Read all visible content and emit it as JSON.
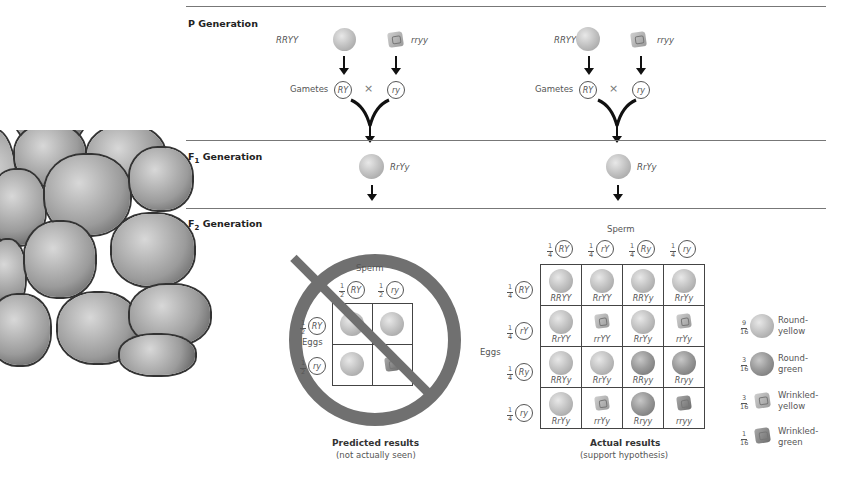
{
  "sections": {
    "p": {
      "label": "P Generation"
    },
    "f1": {
      "label_main": "F",
      "label_sub": "1",
      "label_rest": " Generation"
    },
    "f2": {
      "label_main": "F",
      "label_sub": "2",
      "label_rest": " Generation"
    }
  },
  "left_cross": {
    "parent1": "RRYY",
    "parent2": "rryy",
    "gametes_label": "Gametes",
    "gamete1": "RY",
    "gamete2": "ry",
    "cross_symbol": "×",
    "f1_genotype": "RrYy"
  },
  "right_cross": {
    "parent1": "RRYY",
    "parent2": "rryy",
    "gametes_label": "Gametes",
    "gamete1": "RY",
    "gamete2": "ry",
    "cross_symbol": "×",
    "f1_genotype": "RrYy"
  },
  "predicted": {
    "sperm_label": "Sperm",
    "eggs_label": "Eggs",
    "sperm": [
      {
        "frac_n": "1",
        "frac_d": "2",
        "allele": "RY"
      },
      {
        "frac_n": "1",
        "frac_d": "2",
        "allele": "ry"
      }
    ],
    "eggs": [
      {
        "frac_n": "1",
        "frac_d": "2",
        "allele": "RY"
      },
      {
        "frac_n": "1",
        "frac_d": "2",
        "allele": "ry"
      }
    ],
    "title": "Predicted results",
    "subtitle": "(not actually seen)"
  },
  "actual": {
    "sperm_label": "Sperm",
    "eggs_label": "Eggs",
    "sperm": [
      {
        "frac_n": "1",
        "frac_d": "4",
        "allele": "RY"
      },
      {
        "frac_n": "1",
        "frac_d": "4",
        "allele": "rY"
      },
      {
        "frac_n": "1",
        "frac_d": "4",
        "allele": "Ry"
      },
      {
        "frac_n": "1",
        "frac_d": "4",
        "allele": "ry"
      }
    ],
    "eggs": [
      {
        "frac_n": "1",
        "frac_d": "4",
        "allele": "RY"
      },
      {
        "frac_n": "1",
        "frac_d": "4",
        "allele": "rY"
      },
      {
        "frac_n": "1",
        "frac_d": "4",
        "allele": "Ry"
      },
      {
        "frac_n": "1",
        "frac_d": "4",
        "allele": "ry"
      }
    ],
    "rows": [
      [
        "RRYY",
        "RrYY",
        "RRYy",
        "RrYy"
      ],
      [
        "RrYY",
        "rrYY",
        "RrYy",
        "rrYy"
      ],
      [
        "RRYy",
        "RrYy",
        "RRyy",
        "Rryy"
      ],
      [
        "RrYy",
        "rrYy",
        "Rryy",
        "rryy"
      ]
    ],
    "title": "Actual results",
    "subtitle": "(support hypothesis)"
  },
  "legend": [
    {
      "frac_n": "9",
      "frac_d": "16",
      "label1": "Round-",
      "label2": "yellow"
    },
    {
      "frac_n": "3",
      "frac_d": "16",
      "label1": "Round-",
      "label2": "green"
    },
    {
      "frac_n": "3",
      "frac_d": "16",
      "label1": "Wrinkled-",
      "label2": "yellow"
    },
    {
      "frac_n": "1",
      "frac_d": "16",
      "label1": "Wrinkled-",
      "label2": "green"
    }
  ]
}
